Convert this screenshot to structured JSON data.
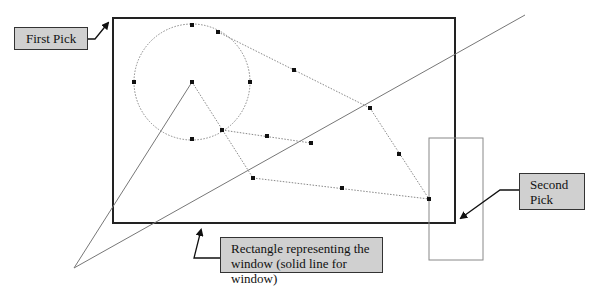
{
  "callouts": {
    "first_pick": "First Pick",
    "second_pick_line1": "Second",
    "second_pick_line2": "Pick",
    "window_line1": "Rectangle representing the",
    "window_line2": "window (solid line for window)"
  },
  "colors": {
    "callout_fill": "#d0d0d0",
    "callout_border": "#333333",
    "window_stroke": "#222222",
    "construction_line": "#777777",
    "grip_point": "#111111"
  }
}
